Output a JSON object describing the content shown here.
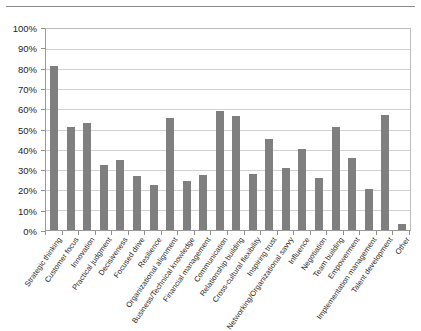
{
  "chart_data": {
    "type": "bar",
    "title": "",
    "subtitle": "",
    "xlabel": "",
    "ylabel": "",
    "ylim": [
      0,
      100
    ],
    "grid": true,
    "legend": false,
    "legend_position": "none",
    "value_unit": "%",
    "bar_color": "#7f7f7f",
    "gridline_color": "#d2d2d2",
    "axis_color": "#8f8f8f",
    "ytick_labels": [
      "100%",
      "90%",
      "80%",
      "70%",
      "60%",
      "50%",
      "40%",
      "30%",
      "20%",
      "10%",
      "0%"
    ],
    "ytick_values": [
      100,
      90,
      80,
      70,
      60,
      50,
      40,
      30,
      20,
      10,
      0
    ],
    "categories": [
      "Strategic thinking",
      "Customer focus",
      "Innovation",
      "Practical judgment",
      "Decisiveness",
      "Focused drive",
      "Resilience",
      "Organizational alignment",
      "Business/Technical knowledge",
      "Financial management",
      "Communication",
      "Relationship building",
      "Cross-cultural flexibility",
      "Inspiring trust",
      "Networking/Organizational savvy",
      "Influence",
      "Negotiation",
      "Team building",
      "Empowerment",
      "Implementation management",
      "Talent development",
      "Other"
    ],
    "values": [
      81.5,
      51.5,
      53,
      32.5,
      35,
      27,
      22.5,
      55.5,
      24.5,
      27.5,
      59,
      56.5,
      28,
      45.5,
      31,
      40.5,
      26,
      51.5,
      36,
      20.5,
      57,
      3
    ]
  }
}
